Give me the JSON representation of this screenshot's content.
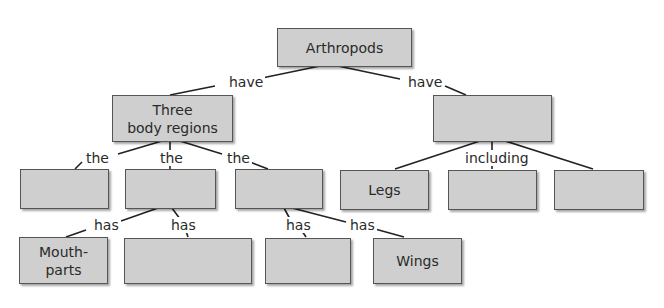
{
  "diagram": {
    "type": "concept-map",
    "nodes": {
      "root": "Arthropods",
      "body_regions": "Three\nbody regions",
      "right_top": "",
      "region_1": "",
      "region_2": "",
      "region_3": "",
      "legs": "Legs",
      "feature_2": "",
      "feature_3": "",
      "mouthparts": "Mouth-\nparts",
      "part_2": "",
      "part_3": "",
      "wings": "Wings"
    },
    "links": {
      "have_left": "have",
      "have_right": "have",
      "the_1": "the",
      "the_2": "the",
      "the_3": "the",
      "including": "including",
      "has_1": "has",
      "has_2": "has",
      "has_3": "has",
      "has_4": "has"
    },
    "colors": {
      "box_fill": "#cfcfcf",
      "box_border": "#555555",
      "line": "#222222",
      "text": "#2a2a2a"
    }
  }
}
